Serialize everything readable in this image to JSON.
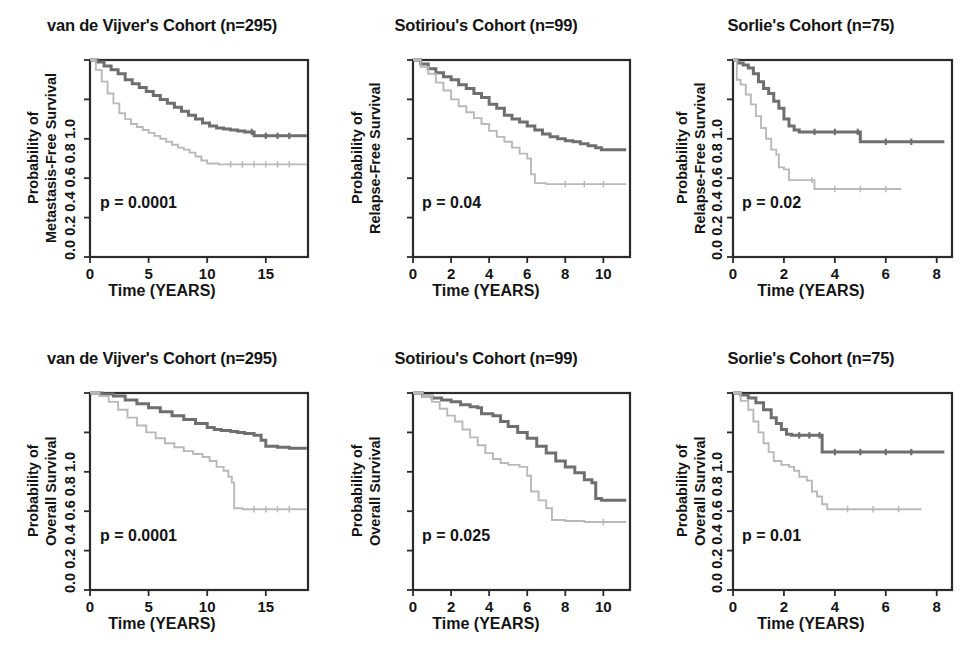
{
  "figure": {
    "background": "#ffffff",
    "rows": 2,
    "cols": 3,
    "colors": {
      "high_group": "#6f6f6f",
      "low_group": "#b9b9b9",
      "axis": "#2b2b2b",
      "text": "#141414"
    }
  },
  "chart_data": [
    {
      "type": "line",
      "panel": "top-left",
      "title": "van de Vijver's Cohort (n=295)",
      "xlabel": "Time (YEARS)",
      "ylabel": "Probability of Metastasis-Free Survival",
      "ylabel_line1": "Probability of",
      "ylabel_line2": "Metastasis-Free Survival",
      "annotation": "p = 0.0001",
      "xlim": [
        0,
        18.6
      ],
      "ylim": [
        0,
        1
      ],
      "xticks": [
        0,
        5,
        10,
        15
      ],
      "yticks": [
        0.0,
        0.2,
        0.4,
        0.6,
        0.8,
        1.0
      ],
      "ytick_labels": "0.0 0.2 0.4 0.6 0.8 1.0",
      "grid": false,
      "legend": "none",
      "series": [
        {
          "name": "high-group",
          "color": "#6f6f6f",
          "x": [
            0,
            0.6,
            1.2,
            1.8,
            2.4,
            3.0,
            3.6,
            4.2,
            4.8,
            5.4,
            6.0,
            6.6,
            7.2,
            7.8,
            8.4,
            9.0,
            9.6,
            10.2,
            10.8,
            11.4,
            12.0,
            12.6,
            13.2,
            13.8,
            14.0,
            15.0,
            16.0,
            17.0,
            18.5
          ],
          "y": [
            1.0,
            0.99,
            0.97,
            0.95,
            0.93,
            0.9,
            0.88,
            0.86,
            0.84,
            0.82,
            0.8,
            0.78,
            0.76,
            0.74,
            0.72,
            0.7,
            0.68,
            0.665,
            0.655,
            0.65,
            0.645,
            0.64,
            0.635,
            0.635,
            0.615,
            0.615,
            0.615,
            0.615,
            0.615
          ]
        },
        {
          "name": "low-group",
          "color": "#b9b9b9",
          "x": [
            0,
            0.5,
            1.0,
            1.5,
            2.0,
            2.5,
            3.0,
            3.5,
            4.0,
            4.5,
            5.0,
            5.5,
            6.0,
            6.5,
            7.0,
            7.5,
            8.0,
            8.5,
            9.0,
            9.5,
            10.0,
            11.0,
            12.0,
            13.0,
            14.0,
            15.0,
            16.0,
            17.0,
            18.5
          ],
          "y": [
            1.0,
            0.95,
            0.89,
            0.83,
            0.78,
            0.73,
            0.7,
            0.675,
            0.66,
            0.645,
            0.63,
            0.615,
            0.6,
            0.585,
            0.57,
            0.555,
            0.545,
            0.53,
            0.51,
            0.49,
            0.475,
            0.47,
            0.47,
            0.47,
            0.47,
            0.47,
            0.47,
            0.47,
            0.47
          ]
        }
      ]
    },
    {
      "type": "line",
      "panel": "top-middle",
      "title": "Sotiriou's Cohort (n=99)",
      "xlabel": "Time (YEARS)",
      "ylabel": "Probability of Relapse-Free Survival",
      "ylabel_line1": "Probability of",
      "ylabel_line2": "Relapse-Free Survival",
      "annotation": "p = 0.04",
      "xlim": [
        0,
        11.4
      ],
      "ylim": [
        0,
        1
      ],
      "xticks": [
        0,
        2,
        4,
        6,
        8,
        10
      ],
      "yticks": [
        0.0,
        0.2,
        0.4,
        0.6,
        0.8,
        1.0
      ],
      "ytick_labels": "0.0 0.2 0.4 0.6 0.8 1.0",
      "grid": false,
      "legend": "none",
      "series": [
        {
          "name": "high-group",
          "color": "#6f6f6f",
          "x": [
            0,
            0.4,
            0.8,
            1.2,
            1.6,
            2.0,
            2.4,
            2.8,
            3.2,
            3.6,
            4.0,
            4.4,
            4.8,
            5.2,
            5.6,
            6.0,
            6.4,
            6.8,
            7.2,
            7.6,
            8.0,
            8.4,
            8.8,
            9.2,
            9.6,
            9.9,
            11.2
          ],
          "y": [
            1.0,
            0.98,
            0.955,
            0.935,
            0.915,
            0.9,
            0.875,
            0.855,
            0.83,
            0.81,
            0.775,
            0.755,
            0.72,
            0.7,
            0.685,
            0.665,
            0.645,
            0.625,
            0.61,
            0.6,
            0.59,
            0.585,
            0.575,
            0.565,
            0.555,
            0.545,
            0.545
          ]
        },
        {
          "name": "low-group",
          "color": "#b9b9b9",
          "x": [
            0,
            0.4,
            0.8,
            1.2,
            1.6,
            2.0,
            2.4,
            2.8,
            3.2,
            3.6,
            4.0,
            4.4,
            4.8,
            5.2,
            5.6,
            6.0,
            6.2,
            6.4,
            7.0,
            8.0,
            9.0,
            10.0,
            11.2
          ],
          "y": [
            1.0,
            0.965,
            0.93,
            0.885,
            0.845,
            0.8,
            0.765,
            0.735,
            0.705,
            0.675,
            0.64,
            0.61,
            0.585,
            0.555,
            0.525,
            0.5,
            0.42,
            0.375,
            0.37,
            0.37,
            0.37,
            0.37,
            0.37
          ]
        }
      ]
    },
    {
      "type": "line",
      "panel": "top-right",
      "title": "Sorlie's Cohort (n=75)",
      "xlabel": "Time (YEARS)",
      "ylabel": "Probability of Relapse-Free Survival",
      "ylabel_line1": "Probability of",
      "ylabel_line2": "Relapse-Free Survival",
      "annotation": "p = 0.02",
      "xlim": [
        0,
        8.6
      ],
      "ylim": [
        0,
        1
      ],
      "xticks": [
        0,
        2,
        4,
        6,
        8
      ],
      "yticks": [
        0.0,
        0.2,
        0.4,
        0.6,
        0.8,
        1.0
      ],
      "ytick_labels": "0.0 0.2 0.4 0.6 0.8 1.0",
      "grid": false,
      "legend": "none",
      "series": [
        {
          "name": "high-group",
          "color": "#6f6f6f",
          "x": [
            0,
            0.2,
            0.4,
            0.6,
            0.8,
            1.0,
            1.2,
            1.4,
            1.6,
            1.8,
            2.0,
            2.2,
            2.4,
            2.6,
            3.2,
            4.0,
            4.9,
            5.0,
            6.0,
            7.0,
            8.3
          ],
          "y": [
            1.0,
            0.985,
            0.975,
            0.96,
            0.93,
            0.89,
            0.855,
            0.83,
            0.79,
            0.755,
            0.7,
            0.665,
            0.645,
            0.635,
            0.635,
            0.635,
            0.635,
            0.585,
            0.585,
            0.585,
            0.585
          ]
        },
        {
          "name": "low-group",
          "color": "#b9b9b9",
          "x": [
            0,
            0.15,
            0.3,
            0.5,
            0.7,
            0.9,
            1.1,
            1.3,
            1.5,
            1.7,
            1.8,
            2.0,
            2.2,
            3.1,
            3.2,
            4.0,
            5.0,
            6.0,
            6.6
          ],
          "y": [
            1.0,
            0.9,
            0.875,
            0.825,
            0.775,
            0.715,
            0.655,
            0.6,
            0.545,
            0.52,
            0.455,
            0.445,
            0.39,
            0.39,
            0.345,
            0.345,
            0.345,
            0.345,
            0.345
          ]
        }
      ]
    },
    {
      "type": "line",
      "panel": "bottom-left",
      "title": "van de Vijver's Cohort (n=295)",
      "xlabel": "Time (YEARS)",
      "ylabel": "Probability of Overall Survival",
      "ylabel_line1": "Probability of",
      "ylabel_line2": "Overall Survival",
      "annotation": "p = 0.0001",
      "xlim": [
        0,
        18.6
      ],
      "ylim": [
        0,
        1
      ],
      "xticks": [
        0,
        5,
        10,
        15
      ],
      "yticks": [
        0.0,
        0.2,
        0.4,
        0.6,
        0.8,
        1.0
      ],
      "ytick_labels": "0.0 0.2 0.4 0.6 0.8 1.0",
      "grid": false,
      "legend": "none",
      "series": [
        {
          "name": "high-group",
          "color": "#6f6f6f",
          "x": [
            0,
            1.0,
            2.0,
            3.0,
            4.0,
            5.0,
            6.0,
            7.0,
            8.0,
            9.0,
            10.0,
            10.6,
            11.2,
            12.0,
            12.6,
            13.2,
            14.0,
            14.6,
            15.0,
            16.0,
            17.0,
            18.5
          ],
          "y": [
            1.0,
            0.995,
            0.985,
            0.965,
            0.945,
            0.925,
            0.905,
            0.885,
            0.865,
            0.845,
            0.825,
            0.815,
            0.81,
            0.805,
            0.8,
            0.795,
            0.785,
            0.76,
            0.73,
            0.725,
            0.72,
            0.72
          ]
        },
        {
          "name": "low-group",
          "color": "#b9b9b9",
          "x": [
            0,
            0.8,
            1.6,
            2.4,
            3.2,
            4.0,
            4.8,
            5.6,
            6.4,
            7.2,
            8.0,
            8.8,
            9.6,
            10.2,
            10.8,
            11.4,
            11.8,
            12.1,
            12.3,
            13.0,
            14.0,
            15.0,
            16.0,
            17.0,
            18.5
          ],
          "y": [
            1.0,
            0.985,
            0.955,
            0.915,
            0.875,
            0.835,
            0.8,
            0.77,
            0.745,
            0.725,
            0.705,
            0.69,
            0.675,
            0.655,
            0.625,
            0.605,
            0.575,
            0.545,
            0.415,
            0.41,
            0.41,
            0.41,
            0.41,
            0.41
          ]
        }
      ]
    },
    {
      "type": "line",
      "panel": "bottom-middle",
      "title": "Sotiriou's Cohort (n=99)",
      "xlabel": "Time (YEARS)",
      "ylabel": "Probability of Overall Survival",
      "ylabel_line1": "Probability of",
      "ylabel_line2": "Overall Survival",
      "annotation": "p = 0.025",
      "xlim": [
        0,
        11.4
      ],
      "ylim": [
        0,
        1
      ],
      "xticks": [
        0,
        2,
        4,
        6,
        8,
        10
      ],
      "yticks": [
        0.0,
        0.2,
        0.4,
        0.6,
        0.8,
        1.0
      ],
      "ytick_labels": "0.0 0.2 0.4 0.6 0.8 1.0",
      "grid": false,
      "legend": "none",
      "series": [
        {
          "name": "high-group",
          "color": "#6f6f6f",
          "x": [
            0,
            0.5,
            1.0,
            1.5,
            2.0,
            2.5,
            3.0,
            3.4,
            3.6,
            4.2,
            4.6,
            5.0,
            5.5,
            6.0,
            6.5,
            7.0,
            7.5,
            8.0,
            8.5,
            9.0,
            9.4,
            9.6,
            9.9,
            11.2
          ],
          "y": [
            1.0,
            0.985,
            0.975,
            0.965,
            0.955,
            0.94,
            0.93,
            0.925,
            0.895,
            0.885,
            0.855,
            0.83,
            0.8,
            0.77,
            0.73,
            0.695,
            0.655,
            0.625,
            0.595,
            0.56,
            0.545,
            0.465,
            0.455,
            0.455
          ]
        },
        {
          "name": "low-group",
          "color": "#b9b9b9",
          "x": [
            0,
            0.5,
            1.0,
            1.4,
            1.8,
            2.2,
            2.6,
            3.0,
            3.4,
            3.8,
            4.2,
            4.6,
            5.0,
            5.6,
            6.0,
            6.2,
            6.6,
            7.0,
            7.3,
            8.0,
            9.0,
            10.0,
            11.2
          ],
          "y": [
            1.0,
            0.985,
            0.955,
            0.92,
            0.885,
            0.855,
            0.815,
            0.775,
            0.735,
            0.695,
            0.665,
            0.645,
            0.635,
            0.625,
            0.58,
            0.5,
            0.455,
            0.415,
            0.355,
            0.35,
            0.345,
            0.345,
            0.345
          ]
        }
      ]
    },
    {
      "type": "line",
      "panel": "bottom-right",
      "title": "Sorlie's Cohort (n=75)",
      "xlabel": "Time (YEARS)",
      "ylabel": "Probability of Overall Survival",
      "ylabel_line1": "Probability of",
      "ylabel_line2": "Overall Survival",
      "annotation": "p = 0.01",
      "xlim": [
        0,
        8.6
      ],
      "ylim": [
        0,
        1
      ],
      "xticks": [
        0,
        2,
        4,
        6,
        8
      ],
      "yticks": [
        0.0,
        0.2,
        0.4,
        0.6,
        0.8,
        1.0
      ],
      "ytick_labels": "0.0 0.2 0.4 0.6 0.8 1.0",
      "grid": false,
      "legend": "none",
      "series": [
        {
          "name": "high-group",
          "color": "#6f6f6f",
          "x": [
            0,
            0.3,
            0.6,
            0.9,
            1.2,
            1.5,
            1.7,
            1.9,
            2.1,
            2.3,
            2.6,
            3.0,
            3.4,
            3.5,
            4.0,
            5.0,
            6.0,
            7.0,
            8.3
          ],
          "y": [
            1.0,
            0.99,
            0.975,
            0.95,
            0.915,
            0.875,
            0.845,
            0.815,
            0.79,
            0.785,
            0.785,
            0.785,
            0.785,
            0.7,
            0.7,
            0.7,
            0.7,
            0.7,
            0.7
          ]
        },
        {
          "name": "low-group",
          "color": "#b9b9b9",
          "x": [
            0,
            0.3,
            0.6,
            0.8,
            1.0,
            1.2,
            1.4,
            1.6,
            1.9,
            2.2,
            2.4,
            2.6,
            2.9,
            3.1,
            3.3,
            3.5,
            3.7,
            4.5,
            5.5,
            6.5,
            7.4
          ],
          "y": [
            1.0,
            0.96,
            0.915,
            0.855,
            0.8,
            0.745,
            0.7,
            0.655,
            0.635,
            0.625,
            0.605,
            0.575,
            0.555,
            0.5,
            0.475,
            0.435,
            0.41,
            0.41,
            0.41,
            0.41,
            0.41
          ]
        }
      ]
    }
  ]
}
